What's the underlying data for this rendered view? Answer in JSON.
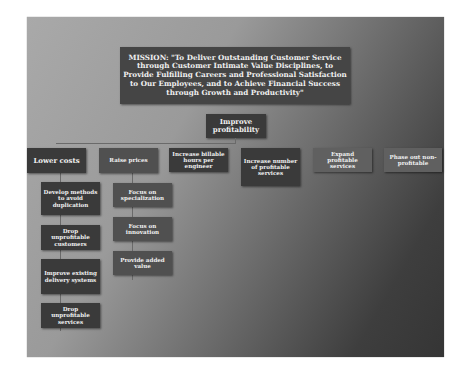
{
  "mission": {
    "text": "MISSION: \"To Deliver Outstanding Customer Service through Customer Intimate Value Disciplines, to Provide Fulfilling Careers and Professional Satisfaction to Our Employees, and to Achieve Financial Success through Growth and Productivity\""
  },
  "root": {
    "label": "Improve profitability"
  },
  "level1": [
    {
      "label": "Lower costs"
    },
    {
      "label": "Raise prices"
    },
    {
      "label": "Increase billable hours per engineer"
    },
    {
      "label": "Increase number of profitable services"
    },
    {
      "label": "Expand profitable services"
    },
    {
      "label": "Phase out non-profitable"
    }
  ],
  "lower_costs_children": [
    {
      "label": "Develop methods to avoid duplication"
    },
    {
      "label": "Drop unprofitable customers"
    },
    {
      "label": "Improve existing delivery systems"
    },
    {
      "label": "Drop unprofitable services"
    }
  ],
  "raise_prices_children": [
    {
      "label": "Focus on specialization"
    },
    {
      "label": "Focus on innovation"
    },
    {
      "label": "Provide added value"
    }
  ]
}
